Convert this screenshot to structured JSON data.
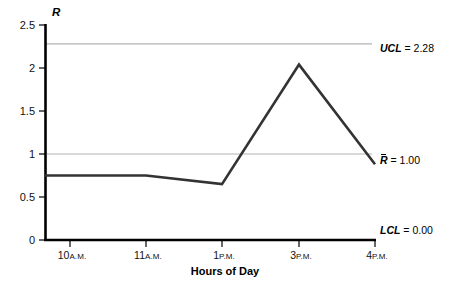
{
  "chart_data": {
    "type": "line",
    "title": "",
    "xlabel": "Hours of Day",
    "ylabel": "R",
    "ylim": [
      0,
      2.5
    ],
    "grid": true,
    "legend": "none",
    "x_categories": [
      "10 A.M.",
      "11 A.M.",
      "1 P.M.",
      "3 P.M.",
      "4 P.M."
    ],
    "x_ticks": [
      {
        "hour": "10",
        "meridiem": "A.M."
      },
      {
        "hour": "11",
        "meridiem": "A.M."
      },
      {
        "hour": "1",
        "meridiem": "P.M."
      },
      {
        "hour": "3",
        "meridiem": "P.M."
      },
      {
        "hour": "4",
        "meridiem": "P.M."
      }
    ],
    "y_ticks": [
      "2.5",
      "2",
      "1.5",
      "1",
      "0.5",
      "0"
    ],
    "y_tick_values": [
      2.5,
      2,
      1.5,
      1,
      0.5,
      0
    ],
    "series": [
      {
        "name": "R",
        "values": [
          0.75,
          0.75,
          0.65,
          2.04,
          0.88
        ],
        "color": "#333333"
      }
    ],
    "control_limits": [
      {
        "id": "ucl",
        "name": "UCL",
        "overline": false,
        "value": "2.28",
        "numeric": 2.28,
        "label": "UCL = 2.28",
        "color": "#b3b3b3"
      },
      {
        "id": "rbar",
        "name": "R",
        "overline": true,
        "value": "1.00",
        "numeric": 1.0,
        "label": "R = 1.00",
        "color": "#b3b3b3"
      },
      {
        "id": "lcl",
        "name": "LCL",
        "overline": false,
        "value": "0.00",
        "numeric": 0.0,
        "label": "LCL = 0.00",
        "color": "#000000"
      }
    ],
    "axis_color": "#000000",
    "line_color": "#333333",
    "gridline_color": "#b3b3b3"
  }
}
